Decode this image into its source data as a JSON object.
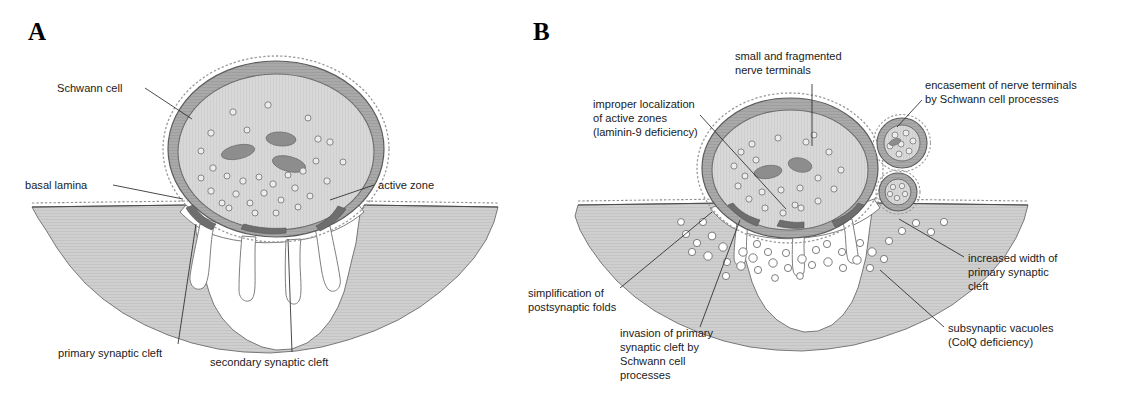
{
  "figure": {
    "background_color": "#ffffff"
  },
  "palette": {
    "muscle_fill": "#cfcfcf",
    "muscle_stroke": "#5a5a5a",
    "schwann_fill": "#a9a9a9",
    "schwann_stroke": "#555555",
    "terminal_fill": "#d6d6d6",
    "terminal_stroke": "#666666",
    "mitochondrion_fill": "#8d8d8d",
    "vesicle_fill": "#e6e6e6",
    "vesicle_stroke": "#6a6a6a",
    "active_zone_fill": "#6e6e6e",
    "basal_lamina_stroke": "#8f8f8f",
    "cleft_fill": "#ffffff",
    "vacuole_fill": "#ffffff",
    "leader_stroke": "#2a2a2a",
    "text_color": "#1a1a1a"
  },
  "panels": [
    {
      "id": "panel-a",
      "letter": "A",
      "letter_x": 28,
      "letter_y": 40,
      "caption_role": "normal neuromuscular junction",
      "annotations": [
        {
          "name": "schwann-cell",
          "lines": [
            "Schwann cell"
          ],
          "text_x": 57,
          "text_y": 92,
          "anchor": "start",
          "leader": "M 145 88 L 192 119"
        },
        {
          "name": "basal-lamina",
          "lines": [
            "basal lamina"
          ],
          "text_x": 25,
          "text_y": 189,
          "anchor": "start",
          "leader": "M 113 185 L 183 199"
        },
        {
          "name": "active-zone",
          "lines": [
            "active zone"
          ],
          "text_x": 378,
          "text_y": 189,
          "anchor": "start",
          "leader": "M 374 185 L 330 200"
        },
        {
          "name": "primary-synaptic-cleft",
          "lines": [
            "primary synaptic cleft"
          ],
          "text_x": 58,
          "text_y": 357,
          "anchor": "start",
          "leader": "M 178 344 L 196 224"
        },
        {
          "name": "secondary-synaptic-cleft",
          "lines": [
            "secondary synaptic cleft"
          ],
          "text_x": 210,
          "text_y": 366,
          "anchor": "start",
          "leader": "M 292 352 L 288 239"
        }
      ],
      "structures": {
        "secondary_cleft_count": 4,
        "mitochondria_count": 3,
        "vesicle_count": 31,
        "active_zone_count": 3,
        "has_subsynaptic_vacuoles": false,
        "has_encased_terminal_fragments": false
      }
    },
    {
      "id": "panel-b",
      "letter": "B",
      "letter_x": 533,
      "letter_y": 40,
      "caption_role": "abnormal neuromuscular junction in congenital myasthenic syndrome",
      "annotations": [
        {
          "name": "small-and-fragmented-nerve-terminals",
          "lines": [
            "small and fragmented",
            "nerve terminals"
          ],
          "text_x": 735,
          "text_y": 60,
          "anchor": "start",
          "leader": "M 812 84 L 812 146"
        },
        {
          "name": "encasement-of-nerve-terminals",
          "lines": [
            "encasement of nerve terminals",
            "by Schwann cell processes"
          ],
          "text_x": 925,
          "text_y": 89,
          "anchor": "start",
          "leader": "M 922 100 L 897 127"
        },
        {
          "name": "improper-localization-of-active-zones",
          "lines": [
            "improper localization",
            "of active zones",
            "(laminin-9 deficiency)"
          ],
          "text_x": 593,
          "text_y": 108,
          "anchor": "start",
          "leader": "M 700 115 L 786 209"
        },
        {
          "name": "simplification-of-postsynaptic-folds",
          "lines": [
            "simplification of",
            "postsynaptic folds"
          ],
          "text_x": 528,
          "text_y": 297,
          "anchor": "start",
          "leader": "M 620 288 L 712 212"
        },
        {
          "name": "invasion-of-primary-synaptic-cleft",
          "lines": [
            "invasion of primary",
            "synaptic cleft by",
            "Schwann cell",
            "processes"
          ],
          "text_x": 620,
          "text_y": 337,
          "anchor": "start",
          "leader": "M 700 327 L 740 220"
        },
        {
          "name": "increased-width-of-primary-synaptic-cleft",
          "lines": [
            "increased width of",
            "primary synaptic",
            "cleft"
          ],
          "text_x": 968,
          "text_y": 262,
          "anchor": "start",
          "leader": "M 964 257 L 899 219"
        },
        {
          "name": "subsynaptic-vacuoles",
          "lines": [
            "subsynaptic vacuoles",
            "(ColQ deficiency)"
          ],
          "text_x": 948,
          "text_y": 332,
          "anchor": "start",
          "leader": "M 944 327 L 880 270"
        }
      ],
      "structures": {
        "secondary_cleft_count": 3,
        "mitochondria_count": 2,
        "vesicle_count": 22,
        "active_zone_count": 3,
        "subsynaptic_vacuole_count": 38,
        "encased_terminal_fragment_count": 2,
        "has_subsynaptic_vacuoles": true,
        "has_encased_terminal_fragments": true
      }
    }
  ]
}
